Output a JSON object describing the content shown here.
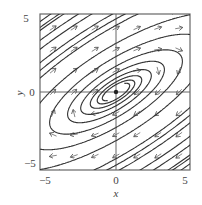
{
  "figure": {
    "type": "phase-portrait",
    "xlabel": "x",
    "ylabel": "y",
    "x_ticks": [
      "−5",
      "0",
      "5"
    ],
    "y_ticks": [
      "5",
      "0",
      "−5"
    ],
    "x_range": [
      -5.5,
      5.5
    ],
    "y_range": [
      -5.5,
      5.5
    ],
    "equilibrium": {
      "x": 0,
      "y": 0,
      "kind": "stable spiral"
    },
    "colors": {
      "frame": "#555555",
      "trajectory": "#333333",
      "arrow": "#555555",
      "background": "#ffffff"
    }
  }
}
